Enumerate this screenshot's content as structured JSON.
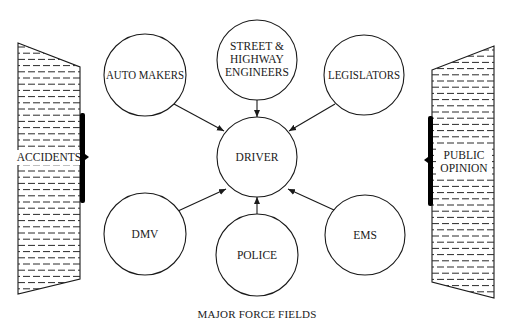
{
  "diagram": {
    "caption": "MAJOR FORCE FIELDS",
    "center_node": {
      "id": "driver",
      "label": "DRIVER",
      "cx": 257,
      "cy": 157,
      "r": 40
    },
    "nodes": [
      {
        "id": "auto-makers",
        "lines": [
          "AUTO MAKERS"
        ],
        "cx": 145,
        "cy": 75,
        "r": 41,
        "arrow_to": "driver"
      },
      {
        "id": "street-highway-engineers",
        "lines": [
          "STREET &",
          "HIGHWAY",
          "ENGINEERS"
        ],
        "cx": 257,
        "cy": 60,
        "r": 40,
        "arrow_to": "driver"
      },
      {
        "id": "legislators",
        "lines": [
          "LEGISLATORS"
        ],
        "cx": 364,
        "cy": 75,
        "r": 40,
        "arrow_to": "driver"
      },
      {
        "id": "dmv",
        "lines": [
          "DMV"
        ],
        "cx": 145,
        "cy": 234,
        "r": 41,
        "arrow_to": "driver"
      },
      {
        "id": "police",
        "lines": [
          "POLICE"
        ],
        "cx": 257,
        "cy": 255,
        "r": 41,
        "arrow_to": "driver"
      },
      {
        "id": "ems",
        "lines": [
          "EMS"
        ],
        "cx": 365,
        "cy": 235,
        "r": 40,
        "arrow_to": "driver"
      }
    ],
    "side_fields": [
      {
        "id": "accidents",
        "lines": [
          "ACCIDENTS"
        ],
        "side": "left"
      },
      {
        "id": "public-opinion",
        "lines": [
          "PUBLIC",
          "OPINION"
        ],
        "side": "right"
      }
    ],
    "colors": {
      "stroke": "#1a1a1a",
      "background": "#ffffff",
      "bar": "#000000"
    }
  }
}
